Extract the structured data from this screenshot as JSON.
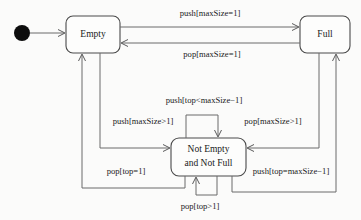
{
  "diagram": {
    "type": "uml-state-machine",
    "colors": {
      "background": "#fbfbfa",
      "node_fill": "#fdfdfc",
      "node_stroke": "#4a4a4a",
      "edge_stroke": "#6b6b6b",
      "text": "#1a1a1a",
      "initial_dot": "#0d0d0d"
    },
    "initial_state": {
      "name": "initial-pseudostate",
      "shape": "filled-circle"
    },
    "states": [
      {
        "id": "empty",
        "label": "Empty",
        "label_line1": "Empty",
        "label_line2": ""
      },
      {
        "id": "full",
        "label": "Full",
        "label_line1": "Full",
        "label_line2": ""
      },
      {
        "id": "not_empty_not_full",
        "label": "Not Empty and Not Full",
        "label_line1": "Not Empty",
        "label_line2": "and Not Full"
      }
    ],
    "transitions": [
      {
        "id": "t1",
        "from": "empty",
        "to": "full",
        "label": "push[maxSize=1]"
      },
      {
        "id": "t2",
        "from": "full",
        "to": "empty",
        "label": "pop[maxSize=1]"
      },
      {
        "id": "t3",
        "from": "not_empty_not_full",
        "to": "not_empty_not_full",
        "label": "push[top<maxSize−1]"
      },
      {
        "id": "t4",
        "from": "empty",
        "to": "not_empty_not_full",
        "label": "push[maxSize>1]"
      },
      {
        "id": "t5",
        "from": "full",
        "to": "not_empty_not_full",
        "label": "pop[maxSize>1]"
      },
      {
        "id": "t6",
        "from": "not_empty_not_full",
        "to": "empty",
        "label": "pop[top=1]"
      },
      {
        "id": "t7",
        "from": "not_empty_not_full",
        "to": "full",
        "label": "push[top=maxSize−1]"
      },
      {
        "id": "t8",
        "from": "not_empty_not_full",
        "to": "not_empty_not_full",
        "label": "pop[top>1]"
      }
    ]
  }
}
